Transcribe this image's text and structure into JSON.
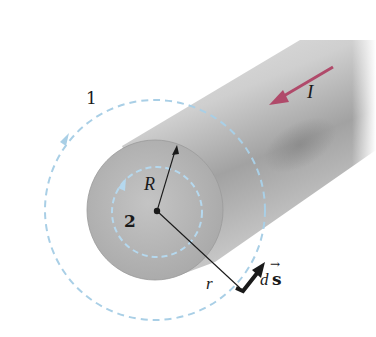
{
  "figure": {
    "colors": {
      "background": "#ffffff",
      "cylinder_light": "#d6d6d6",
      "cylinder_mid": "#b4b4b4",
      "cylinder_dark": "#8e8e8e",
      "end_face": "#b9b9b9",
      "loop_dashed": "#a9cfe6",
      "current_arrow": "#b04a6a",
      "vector_arrow": "#1a1a1a"
    },
    "labels": {
      "loop_outer": "1",
      "loop_inner": "2",
      "radius_wire": "R",
      "radius_loop": "r",
      "current": "I",
      "path_element_d": "d",
      "path_element_s": "s",
      "vector_arrow_glyph": "→"
    },
    "geometry": {
      "center": [
        156,
        210
      ],
      "wire_radius_px": 68,
      "outer_loop_radius_px": 110,
      "inner_loop_radius_px": 45
    }
  }
}
